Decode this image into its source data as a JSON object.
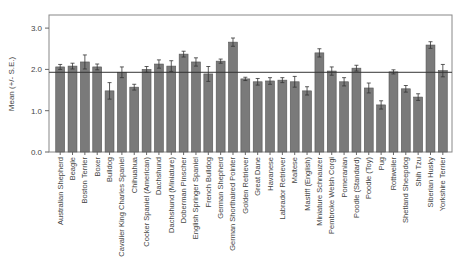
{
  "chart_data": {
    "type": "bar",
    "title": "",
    "xlabel": "",
    "ylabel": "Mean (+/- S.E.)",
    "ylim": [
      0,
      3.0
    ],
    "yticks": [
      "0.0",
      "1.0",
      "2.0",
      "3.0"
    ],
    "reference_line": 1.93,
    "grid": false,
    "legend": null,
    "bar_color": "#7a7a7a",
    "categories": [
      "Australian Shepherd",
      "Beagle",
      "Boston Terrier",
      "Boxer",
      "Bulldog",
      "Cavalier King Charles Spaniel",
      "Chihuahua",
      "Cocker Spaniel (American)",
      "Dachshund",
      "Dachshund (Miniature)",
      "Doberman Pinscher",
      "English Springer Spaniel",
      "French Bulldog",
      "German Shepherd",
      "German Shorthaired Pointer",
      "Golden Retriever",
      "Great Dane",
      "Havanese",
      "Labrador Retriever",
      "Maltese",
      "Mastiff (English)",
      "Miniature Schnauzer",
      "Pembroke Welsh Corgi",
      "Pomeranian",
      "Poodle (Standard)",
      "Poodle (Toy)",
      "Pug",
      "Rottweiler",
      "Shetland Sheepdog",
      "Shih Tzu",
      "Siberian Husky",
      "Yorkshire Terrier"
    ],
    "values": [
      2.06,
      2.08,
      2.18,
      2.06,
      1.48,
      1.93,
      1.57,
      2.0,
      2.13,
      2.08,
      2.37,
      2.18,
      1.89,
      2.2,
      2.66,
      1.77,
      1.7,
      1.72,
      1.74,
      1.7,
      1.48,
      2.4,
      1.96,
      1.7,
      2.03,
      1.55,
      1.14,
      1.94,
      1.53,
      1.33,
      2.59,
      1.97
    ],
    "errors": [
      0.06,
      0.07,
      0.17,
      0.07,
      0.2,
      0.13,
      0.07,
      0.07,
      0.1,
      0.13,
      0.07,
      0.1,
      0.18,
      0.05,
      0.1,
      0.04,
      0.08,
      0.08,
      0.06,
      0.13,
      0.1,
      0.1,
      0.1,
      0.1,
      0.07,
      0.12,
      0.1,
      0.05,
      0.08,
      0.08,
      0.08,
      0.15
    ]
  }
}
